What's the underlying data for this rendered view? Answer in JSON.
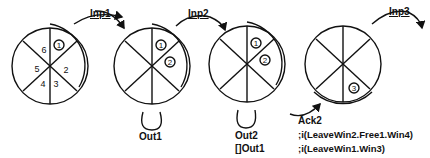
{
  "diagram": {
    "states": [
      {
        "id": "state-1",
        "segments": [
          "1",
          "2",
          "3",
          "4",
          "5",
          "6"
        ],
        "tokens": [
          "1"
        ]
      },
      {
        "id": "state-2",
        "segments": [],
        "tokens": [
          "1",
          "2"
        ]
      },
      {
        "id": "state-3",
        "segments": [],
        "tokens": [
          "1",
          "2"
        ]
      },
      {
        "id": "state-4",
        "segments": [],
        "tokens": [
          "3"
        ]
      }
    ],
    "transitions": [
      {
        "label": "Inp1"
      },
      {
        "label": "Inp2"
      },
      {
        "label": "Inp3"
      }
    ],
    "self_loops": [
      {
        "label": "Out1"
      },
      {
        "label": "Out2",
        "sub": "[]Out1"
      }
    ],
    "ack": {
      "label": "Ack2",
      "lines": [
        ";i(LeaveWin2.Free1.Win4)",
        ";i(LeaveWin1.Win3)"
      ]
    },
    "colors": {
      "stroke": "#111111",
      "background": "#ffffff"
    }
  }
}
